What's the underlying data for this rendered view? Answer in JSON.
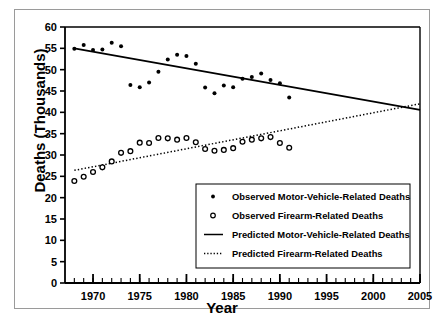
{
  "chart_data": {
    "type": "scatter",
    "title": "",
    "xlabel": "Year",
    "ylabel": "Deaths (Thousands)",
    "xlim": [
      1967,
      2005
    ],
    "ylim": [
      0,
      60
    ],
    "xticks_major": [
      1970,
      1975,
      1980,
      1985,
      1990,
      1995,
      2000,
      2005
    ],
    "xticks_minor_step": 1,
    "yticks": [
      0,
      5,
      10,
      15,
      20,
      25,
      30,
      35,
      40,
      45,
      50,
      55,
      60
    ],
    "grid": false,
    "legend_position": "inside-lower-right",
    "series": [
      {
        "name": "Observed Motor-Vehicle-Related Deaths",
        "marker": "filled-circle",
        "type": "scatter",
        "x": [
          1968,
          1969,
          1970,
          1971,
          1972,
          1973,
          1974,
          1975,
          1976,
          1977,
          1978,
          1979,
          1980,
          1981,
          1982,
          1983,
          1984,
          1985,
          1986,
          1987,
          1988,
          1989,
          1990,
          1991
        ],
        "y": [
          54.9,
          55.8,
          54.6,
          54.7,
          56.3,
          55.5,
          46.4,
          45.9,
          47.0,
          49.5,
          52.4,
          53.5,
          53.2,
          51.4,
          45.8,
          44.5,
          46.3,
          45.9,
          47.9,
          48.3,
          49.1,
          47.6,
          46.8,
          43.5
        ]
      },
      {
        "name": "Observed Firearm-Related Deaths",
        "marker": "open-circle",
        "type": "scatter",
        "x": [
          1968,
          1969,
          1970,
          1971,
          1972,
          1973,
          1974,
          1975,
          1976,
          1977,
          1978,
          1979,
          1980,
          1981,
          1982,
          1983,
          1984,
          1985,
          1986,
          1987,
          1988,
          1989,
          1990,
          1991
        ],
        "y": [
          23.9,
          24.9,
          26.0,
          27.1,
          28.5,
          30.5,
          30.9,
          32.9,
          32.8,
          34.0,
          33.9,
          33.6,
          34.0,
          33.0,
          31.4,
          31.0,
          31.2,
          31.6,
          33.1,
          33.6,
          33.9,
          34.2,
          32.8,
          31.7
        ]
      },
      {
        "name": "Predicted Motor-Vehicle-Related Deaths",
        "type": "line",
        "style": "solid",
        "endpoints": [
          {
            "x": 1968,
            "y": 55.0
          },
          {
            "x": 2005,
            "y": 40.6
          }
        ]
      },
      {
        "name": "Predicted Firearm-Related Deaths",
        "type": "line",
        "style": "dotted",
        "endpoints": [
          {
            "x": 1968,
            "y": 26.4
          },
          {
            "x": 2005,
            "y": 42.0
          }
        ]
      }
    ],
    "crossover": {
      "x": 2002,
      "y": 41.5
    },
    "legend": [
      {
        "label": "Observed Motor-Vehicle-Related Deaths",
        "marker": "filled-circle"
      },
      {
        "label": "Observed Firearm-Related Deaths",
        "marker": "open-circle"
      },
      {
        "label": "Predicted Motor-Vehicle-Related Deaths",
        "marker": "solid-line"
      },
      {
        "label": "Predicted Firearm-Related Deaths",
        "marker": "dotted-line"
      }
    ]
  },
  "axes": {
    "x_tick_labels": [
      "1970",
      "1975",
      "1980",
      "1985",
      "1990",
      "1995",
      "2000",
      "2005"
    ],
    "y_tick_labels": [
      "0",
      "5",
      "10",
      "15",
      "20",
      "25",
      "30",
      "35",
      "40",
      "45",
      "50",
      "55",
      "60"
    ],
    "x_title": "Year",
    "y_title": "Deaths (Thousands)"
  },
  "colors": {
    "ink": "#000000",
    "frame": "#9a9a9a",
    "background": "#ffffff"
  }
}
